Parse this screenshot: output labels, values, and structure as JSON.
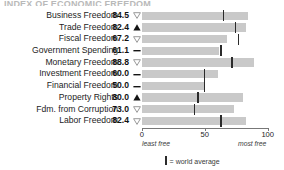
{
  "title_remnant": "INDEX OF ECONOMIC FREEDOM",
  "axis": {
    "min": 0,
    "max": 100,
    "ticks": [
      {
        "value": 0,
        "label": "0"
      },
      {
        "value": 50,
        "label": "50"
      },
      {
        "value": 100,
        "label": "100"
      }
    ],
    "left_note": "least free",
    "right_note": "most free"
  },
  "legend": {
    "marker": "|",
    "text": "= world average"
  },
  "chart_data": {
    "type": "bar",
    "title": "INDEX OF ECONOMIC FREEDOM",
    "xlabel": "",
    "ylabel": "",
    "xlim": [
      0,
      100
    ],
    "grid": false,
    "legend_position": "bottom",
    "orientation": "horizontal",
    "categories": [
      "Business Freedom",
      "Trade Freedom",
      "Fiscal Freedom",
      "Government Spending",
      "Monetary Freedom",
      "Investment Freedom",
      "Financial Freedom",
      "Property Rights",
      "Fdm. from Corruption",
      "Labor Freedom"
    ],
    "values": [
      84.5,
      82.4,
      67.2,
      61.1,
      88.8,
      60.0,
      50.0,
      80.0,
      73.0,
      82.4
    ],
    "value_labels": [
      "84.5",
      "82.4",
      "67.2",
      "61.1",
      "88.8",
      "60.0",
      "50.0",
      "80.0",
      "73.0",
      "82.4"
    ],
    "trends": [
      "down",
      "up",
      "down",
      "flat",
      "down",
      "flat",
      "flat",
      "up",
      "down",
      "down"
    ],
    "series": [
      {
        "name": "score",
        "values": [
          84.5,
          82.4,
          67.2,
          61.1,
          88.8,
          60.0,
          50.0,
          80.0,
          73.0,
          82.4
        ]
      },
      {
        "name": "world average",
        "values": [
          64.0,
          73.5,
          76.0,
          62.0,
          71.0,
          49.0,
          49.0,
          44.0,
          41.0,
          62.0
        ]
      }
    ]
  },
  "rows": [
    {
      "label": "Business Freedom",
      "score": "84.5",
      "value": 84.5,
      "avg": 64.0,
      "trend": "down"
    },
    {
      "label": "Trade Freedom",
      "score": "82.4",
      "value": 82.4,
      "avg": 73.5,
      "trend": "up"
    },
    {
      "label": "Fiscal Freedom",
      "score": "67.2",
      "value": 67.2,
      "avg": 76.0,
      "trend": "down"
    },
    {
      "label": "Government Spending",
      "score": "61.1",
      "value": 61.1,
      "avg": 62.0,
      "trend": "flat"
    },
    {
      "label": "Monetary Freedom",
      "score": "88.8",
      "value": 88.8,
      "avg": 71.0,
      "trend": "down"
    },
    {
      "label": "Investment Freedom",
      "score": "60.0",
      "value": 60.0,
      "avg": 49.0,
      "trend": "flat"
    },
    {
      "label": "Financial Freedom",
      "score": "50.0",
      "value": 50.0,
      "avg": 49.0,
      "trend": "flat"
    },
    {
      "label": "Property Rights",
      "score": "80.0",
      "value": 80.0,
      "avg": 44.0,
      "trend": "up"
    },
    {
      "label": "Fdm. from Corruption",
      "score": "73.0",
      "value": 73.0,
      "avg": 41.0,
      "trend": "down"
    },
    {
      "label": "Labor Freedom",
      "score": "82.4",
      "value": 82.4,
      "avg": 62.0,
      "trend": "down"
    }
  ],
  "colors": {
    "bar": "#c9c9c9",
    "average_marker": "#2b2b2b",
    "axis": "#777777",
    "text": "#1a1a1a"
  }
}
